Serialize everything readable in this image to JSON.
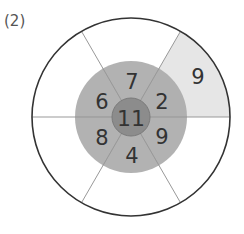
{
  "problem_label": "(2)",
  "diagram": {
    "center_value": "11",
    "inner_ring": [
      {
        "position": "top",
        "value": "7"
      },
      {
        "position": "upper-right",
        "value": "2"
      },
      {
        "position": "lower-right",
        "value": "9"
      },
      {
        "position": "bottom",
        "value": "4"
      },
      {
        "position": "lower-left",
        "value": "8"
      },
      {
        "position": "upper-left",
        "value": "6"
      }
    ],
    "outer_ring": [
      {
        "position": "upper-right",
        "value": "9",
        "shaded": true
      },
      {
        "position": "top",
        "value": "",
        "shaded": false
      },
      {
        "position": "upper-left",
        "value": "",
        "shaded": false
      },
      {
        "position": "lower-left",
        "value": "",
        "shaded": false
      },
      {
        "position": "bottom",
        "value": "",
        "shaded": false
      },
      {
        "position": "lower-right",
        "value": "",
        "shaded": false
      }
    ],
    "colors": {
      "center": "#8c8c8c",
      "inner_ring": "#ababab",
      "shaded_outer": "#e6e6e6",
      "outer": "#ffffff",
      "outline": "#333333",
      "divider": "#999999"
    }
  }
}
